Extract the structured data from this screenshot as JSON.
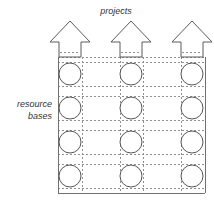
{
  "diagram": {
    "title_label": "projects",
    "side_label_line1": "resource",
    "side_label_line2": "bases",
    "colors": {
      "background": "#ffffff",
      "dashed_line": "#909090",
      "solid_line": "#707070",
      "circle_stroke": "#555555",
      "arrow_stroke": "#5a5a5a",
      "text": "#333333"
    },
    "columns": [
      {
        "name": "project-column-1",
        "center_x": 70
      },
      {
        "name": "project-column-2",
        "center_x": 131
      },
      {
        "name": "project-column-3",
        "center_x": 192
      }
    ],
    "rows": [
      {
        "name": "resource-base-row-1",
        "center_y": 74
      },
      {
        "name": "resource-base-row-2",
        "center_y": 108
      },
      {
        "name": "resource-base-row-3",
        "center_y": 142
      },
      {
        "name": "resource-base-row-4",
        "center_y": 176
      }
    ],
    "node_radius": 11,
    "arrows": [
      {
        "name": "project-arrow-1",
        "center_x": 70
      },
      {
        "name": "project-arrow-2",
        "center_x": 131
      },
      {
        "name": "project-arrow-3",
        "center_x": 192
      }
    ],
    "counts": {
      "projects": 3,
      "resource_bases": 4,
      "nodes": 12
    }
  }
}
